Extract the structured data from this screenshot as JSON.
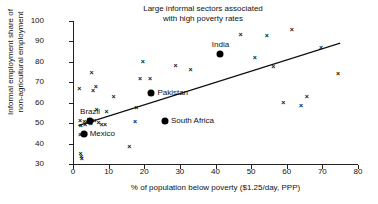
{
  "chart_data": {
    "type": "scatter",
    "title": "Large informal sectors associated\nwith high poverty rates",
    "xlabel": "% of population below poverty ($1.25/day, PPP)",
    "ylabel": "Informal employment share of\nnon-agricultural employment",
    "xlim": [
      0,
      80
    ],
    "ylim": [
      30,
      100
    ],
    "xticks": [
      0,
      10,
      20,
      30,
      40,
      50,
      60,
      70,
      80
    ],
    "yticks": [
      30,
      40,
      50,
      60,
      70,
      80,
      90,
      100
    ],
    "grid": false,
    "legend": "none",
    "marker_unlabeled": "x",
    "marker_labeled": "filled-circle",
    "series": [
      {
        "name": "Countries (unlabeled)",
        "marker": "x",
        "points": [
          {
            "x": 1.8,
            "y": 67.0
          },
          {
            "x": 2.0,
            "y": 51.5
          },
          {
            "x": 2.2,
            "y": 49.0
          },
          {
            "x": 2.0,
            "y": 44.5
          },
          {
            "x": 2.1,
            "y": 35.5
          },
          {
            "x": 2.3,
            "y": 34.0
          },
          {
            "x": 2.5,
            "y": 33.0
          },
          {
            "x": 3.2,
            "y": 51.0
          },
          {
            "x": 3.4,
            "y": 49.5
          },
          {
            "x": 3.6,
            "y": 45.0
          },
          {
            "x": 4.0,
            "y": 50.5
          },
          {
            "x": 4.4,
            "y": 52.0
          },
          {
            "x": 5.0,
            "y": 50.0
          },
          {
            "x": 5.2,
            "y": 74.8
          },
          {
            "x": 5.6,
            "y": 66.0
          },
          {
            "x": 6.0,
            "y": 51.5
          },
          {
            "x": 6.4,
            "y": 68.0
          },
          {
            "x": 6.6,
            "y": 56.7
          },
          {
            "x": 7.2,
            "y": 50.5
          },
          {
            "x": 8.0,
            "y": 49.8
          },
          {
            "x": 9.0,
            "y": 49.4
          },
          {
            "x": 9.4,
            "y": 56.0
          },
          {
            "x": 11.4,
            "y": 63.4
          },
          {
            "x": 15.8,
            "y": 38.6
          },
          {
            "x": 17.4,
            "y": 51.0
          },
          {
            "x": 17.8,
            "y": 58.0
          },
          {
            "x": 18.8,
            "y": 72.0
          },
          {
            "x": 19.6,
            "y": 80.2
          },
          {
            "x": 21.6,
            "y": 72.3
          },
          {
            "x": 28.8,
            "y": 78.3
          },
          {
            "x": 33.0,
            "y": 76.4
          },
          {
            "x": 47.0,
            "y": 93.6
          },
          {
            "x": 51.0,
            "y": 82.2
          },
          {
            "x": 54.4,
            "y": 93.3
          },
          {
            "x": 56.2,
            "y": 78.0
          },
          {
            "x": 59.0,
            "y": 60.2
          },
          {
            "x": 61.4,
            "y": 96.0
          },
          {
            "x": 64.0,
            "y": 59.0
          },
          {
            "x": 65.6,
            "y": 63.3
          },
          {
            "x": 69.6,
            "y": 87.3
          },
          {
            "x": 74.4,
            "y": 74.6
          }
        ]
      },
      {
        "name": "Highlighted countries",
        "marker": "filled-circle",
        "points": [
          {
            "x": 4.8,
            "y": 51.0,
            "label": "Brazil",
            "label_pos": "above"
          },
          {
            "x": 3.0,
            "y": 44.5,
            "label": "Mexico",
            "label_pos": "right"
          },
          {
            "x": 41.4,
            "y": 84.0,
            "label": "India",
            "label_pos": "above"
          },
          {
            "x": 22.0,
            "y": 65.0,
            "label": "Pakistan",
            "label_pos": "right"
          },
          {
            "x": 25.8,
            "y": 51.0,
            "label": "South Africa",
            "label_pos": "right"
          }
        ]
      }
    ],
    "trendline": {
      "type": "linear",
      "x_start": 1.5,
      "y_start": 48.8,
      "x_end": 75.0,
      "y_end": 89.2
    }
  }
}
